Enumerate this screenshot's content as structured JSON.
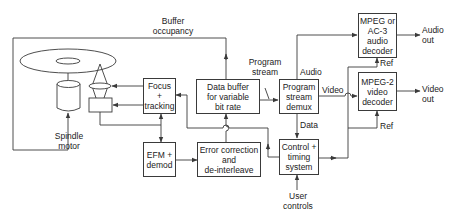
{
  "diagram": {
    "type": "block-diagram",
    "stroke_color": "#3a3a3a",
    "text_color": "#222222",
    "blocks": {
      "focus_tracking": {
        "lines": [
          "Focus",
          "+",
          "tracking"
        ]
      },
      "data_buffer": {
        "lines": [
          "Data buffer",
          "for variable",
          "bit rate"
        ]
      },
      "demux": {
        "lines": [
          "Program",
          "stream",
          "demux"
        ]
      },
      "audio_decoder": {
        "lines": [
          "MPEG or",
          "AC-3",
          "audio",
          "decoder"
        ]
      },
      "video_decoder": {
        "lines": [
          "MPEG-2",
          "video",
          "decoder"
        ]
      },
      "efm": {
        "lines": [
          "EFM +",
          "demod"
        ]
      },
      "error_correction": {
        "lines": [
          "Error correction",
          "and",
          "de-interleave"
        ]
      },
      "control": {
        "lines": [
          "Control +",
          "timing",
          "system"
        ]
      }
    },
    "labels": {
      "buffer_occupancy": [
        "Buffer",
        "occupancy"
      ],
      "program_stream": [
        "Program",
        "stream"
      ],
      "spindle_motor": [
        "Spindle",
        "motor"
      ],
      "audio": "Audio",
      "video": "Video",
      "data": "Data",
      "ref_audio": "Ref",
      "ref_video": "Ref",
      "audio_out": [
        "Audio",
        "out"
      ],
      "video_out": [
        "Video",
        "out"
      ],
      "user_controls": [
        "User",
        "controls"
      ]
    },
    "icons": [
      "disc-icon",
      "spindle-motor-icon",
      "optical-pickup-icon",
      "lens-icon"
    ],
    "connections": [
      {
        "from": "Data buffer",
        "to": "Spindle motor",
        "label": "Buffer occupancy"
      },
      {
        "from": "Focus + tracking",
        "to": "Lens"
      },
      {
        "from": "Focus + tracking",
        "to": "Pickup"
      },
      {
        "from": "Pickup",
        "to": "EFM + demod"
      },
      {
        "from": "Pickup",
        "to": "Focus + tracking"
      },
      {
        "from": "EFM + demod",
        "to": "Error correction and de-interleave"
      },
      {
        "from": "Error correction and de-interleave",
        "to": "Data buffer"
      },
      {
        "from": "Data buffer",
        "to": "Program stream demux",
        "label": "Program stream"
      },
      {
        "from": "Program stream demux",
        "to": "MPEG or AC-3 audio decoder",
        "label": "Audio"
      },
      {
        "from": "Program stream demux",
        "to": "MPEG-2 video decoder",
        "label": "Video"
      },
      {
        "from": "Program stream demux",
        "to": "Control + timing system",
        "label": "Data"
      },
      {
        "from": "Control + timing system",
        "to": "Focus + tracking"
      },
      {
        "from": "Control + timing system",
        "to": "MPEG or AC-3 audio decoder",
        "label": "Ref"
      },
      {
        "from": "Control + timing system",
        "to": "MPEG-2 video decoder",
        "label": "Ref"
      },
      {
        "from": "User controls",
        "to": "Control + timing system"
      },
      {
        "from": "MPEG or AC-3 audio decoder",
        "to": "Audio out"
      },
      {
        "from": "MPEG-2 video decoder",
        "to": "Video out"
      }
    ]
  }
}
